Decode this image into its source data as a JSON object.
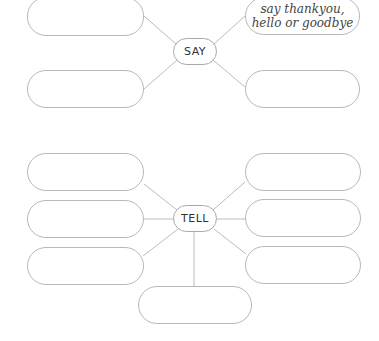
{
  "diagram": {
    "type": "word map / spider diagram",
    "colors": {
      "outline": "#b8b8b8",
      "text": "#444444",
      "background": "#ffffff"
    },
    "say": {
      "hub_label": "SAY",
      "branches": [
        {
          "position": "top-left",
          "text": ""
        },
        {
          "position": "top-right",
          "text": "say thankyou,\nhello or goodbye"
        },
        {
          "position": "bottom-left",
          "text": ""
        },
        {
          "position": "bottom-right",
          "text": ""
        }
      ]
    },
    "tell": {
      "hub_label": "TELL",
      "branches": [
        {
          "position": "left-1",
          "text": ""
        },
        {
          "position": "left-2",
          "text": ""
        },
        {
          "position": "left-3",
          "text": ""
        },
        {
          "position": "right-1",
          "text": ""
        },
        {
          "position": "right-2",
          "text": ""
        },
        {
          "position": "right-3",
          "text": ""
        },
        {
          "position": "bottom",
          "text": ""
        }
      ]
    }
  }
}
